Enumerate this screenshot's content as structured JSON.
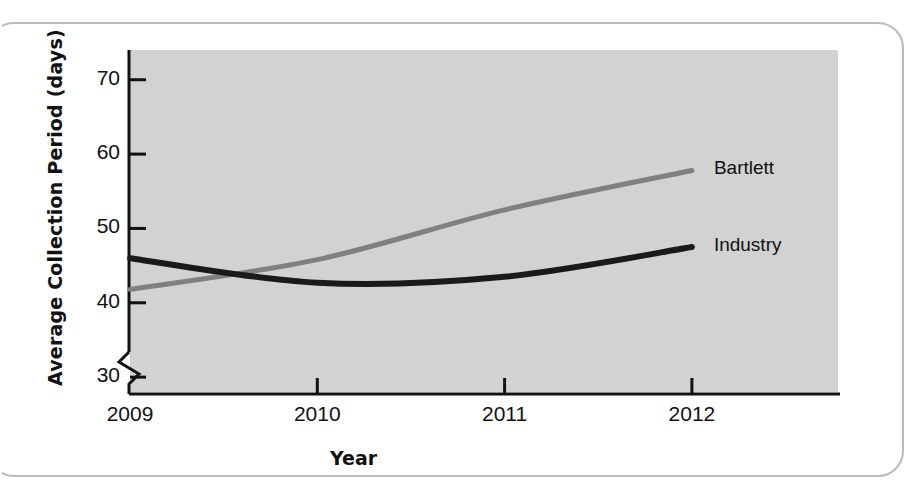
{
  "figure": {
    "frame_color": "#b9bcbe",
    "plot_background": "#d2d2d2"
  },
  "chart_data": {
    "type": "line",
    "title": "",
    "subtitle": "",
    "xlabel": "Year",
    "ylabel": "Average Collection Period (days)",
    "categories": [
      "2009",
      "2010",
      "2011",
      "2012"
    ],
    "x": [
      2009,
      2010,
      2011,
      2012
    ],
    "xlim": [
      2009,
      2012
    ],
    "ylim": [
      28,
      74
    ],
    "y_ticks": [
      30,
      40,
      50,
      60,
      70
    ],
    "y_tick_labels": [
      "30",
      "40",
      "50",
      "60",
      "70"
    ],
    "x_ticks": [
      2009,
      2010,
      2011,
      2012
    ],
    "x_tick_labels": [
      "2009",
      "2010",
      "2011",
      "2012"
    ],
    "axis_break": true,
    "axis_break_note": "zigzag break on y-axis below 30",
    "grid": false,
    "legend_position": "right-inline-labels",
    "series": [
      {
        "name": "Bartlett",
        "color": "#808080",
        "label": "Bartlett",
        "values": [
          41.8,
          45.8,
          52.5,
          57.8
        ]
      },
      {
        "name": "Industry",
        "color": "#1a1a1a",
        "label": "Industry",
        "values": [
          46.0,
          42.7,
          43.5,
          47.5
        ]
      }
    ],
    "annotations": [
      {
        "text": "Bartlett",
        "series": "Bartlett",
        "at_x": 2012
      },
      {
        "text": "Industry",
        "series": "Industry",
        "at_x": 2012
      }
    ]
  }
}
